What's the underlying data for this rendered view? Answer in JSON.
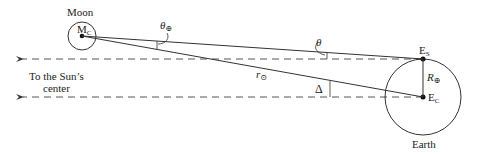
{
  "labels": {
    "moon": "Moon",
    "moon_center": "M",
    "moon_center_sub": "C",
    "earth": "Earth",
    "earth_surface": "E",
    "earth_surface_sub": "S",
    "earth_center": "E",
    "earth_center_sub": "C",
    "sun_direction_line1": "To the Sun’s",
    "sun_direction_line2": "center",
    "theta_sun": "θ",
    "theta_sun_sub": "⊕",
    "theta": "θ",
    "delta": "Δ",
    "r_sun": "r",
    "r_sun_sub": "⊙",
    "earth_radius": "R",
    "earth_radius_sub": "⊕"
  },
  "geometry": {
    "moon": {
      "cx": 82,
      "cy": 36,
      "r": 14
    },
    "earth": {
      "cx": 423,
      "cy": 97,
      "r": 38
    },
    "earth_surface_point": {
      "x": 423,
      "y": 59
    },
    "earth_center_point": {
      "x": 423,
      "y": 97
    }
  },
  "colors": {
    "stroke": "#333333",
    "dash": "#555555",
    "text": "#222222"
  }
}
